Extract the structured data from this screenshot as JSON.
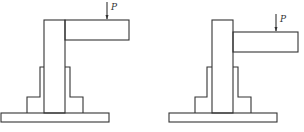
{
  "diagram": {
    "figures": [
      {
        "id": "left",
        "load_label": "P",
        "description": "Column with cantilever beam attached at top, load P applied downward on beam, stepped base on hatched ground"
      },
      {
        "id": "right",
        "load_label": "P",
        "description": "Column with cantilever beam attached below top, load P applied downward on beam, stepped base on hatched ground"
      }
    ],
    "colors": {
      "stroke": "#333333",
      "background": "#ffffff"
    }
  }
}
